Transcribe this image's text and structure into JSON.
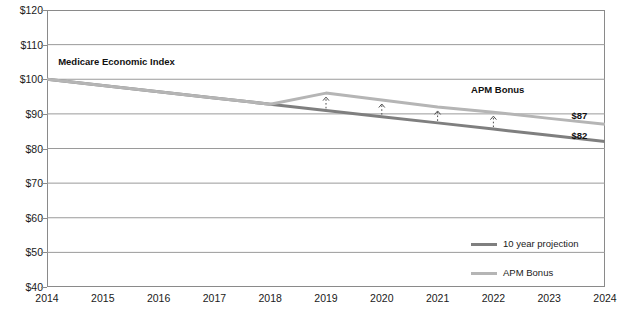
{
  "chart_data": {
    "type": "line",
    "title": "",
    "xlabel": "",
    "ylabel": "",
    "x": [
      2014,
      2015,
      2016,
      2017,
      2018,
      2019,
      2020,
      2021,
      2022,
      2023,
      2024
    ],
    "xtick_labels": [
      "2014",
      "2015",
      "2016",
      "2017",
      "2018",
      "2019",
      "2020",
      "2021",
      "2022",
      "2023",
      "2024"
    ],
    "ytick_labels": [
      "$120",
      "$110",
      "$100",
      "$90",
      "$80",
      "$70",
      "$60",
      "$50",
      "$40"
    ],
    "ytick_values": [
      120,
      110,
      100,
      90,
      80,
      70,
      60,
      50,
      40
    ],
    "ylim": [
      40,
      120
    ],
    "xlim": [
      2014,
      2024
    ],
    "grid": true,
    "legend_position": "bottom-right",
    "series": [
      {
        "name": "10 year projection",
        "color": "#7f7f7f",
        "values": [
          100,
          98.2,
          96.4,
          94.6,
          92.8,
          91.0,
          89.2,
          87.4,
          85.6,
          83.8,
          82
        ]
      },
      {
        "name": "APM Bonus",
        "color": "#b5b5b5",
        "values": [
          100,
          98.2,
          96.4,
          94.6,
          92.8,
          96.0,
          94.0,
          92.0,
          90.5,
          88.7,
          87
        ]
      }
    ],
    "annotations": [
      {
        "name": "medicare-economic-index-label",
        "text": "Medicare Economic Index",
        "x": 2014.2,
        "y": 103.5
      },
      {
        "name": "apm-bonus-callout",
        "text": "APM Bonus",
        "x": 2021.6,
        "y": 95.5
      },
      {
        "name": "endpoint-label-apm",
        "text": "$87",
        "x": 2023.4,
        "y": 87.8
      },
      {
        "name": "endpoint-label-projection",
        "text": "$82",
        "x": 2023.4,
        "y": 82.2
      }
    ],
    "bonus_arrows": [
      {
        "x": 2019,
        "from": 91.0,
        "to": 96.0
      },
      {
        "x": 2020,
        "from": 89.2,
        "to": 94.0
      },
      {
        "x": 2021,
        "from": 87.4,
        "to": 92.0
      },
      {
        "x": 2022,
        "from": 85.6,
        "to": 90.5
      }
    ]
  },
  "legend": {
    "items": [
      {
        "label": "10 year projection",
        "color": "#7f7f7f"
      },
      {
        "label": "APM Bonus",
        "color": "#b5b5b5"
      }
    ]
  },
  "footer": {
    "text": ""
  }
}
